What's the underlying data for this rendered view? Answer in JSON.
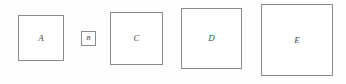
{
  "figure": {
    "background_color": "#fefefe",
    "border_color": "#8a8a8a",
    "label_color": "#4a4a4a",
    "width": 346,
    "height": 84,
    "squares": [
      {
        "label": "A",
        "x": 18,
        "y": 15,
        "size": 46,
        "size_class": "size-sm",
        "name": "square-a"
      },
      {
        "label": "B",
        "x": 81,
        "y": 31,
        "size": 15,
        "size_class": "size-xs",
        "name": "square-b"
      },
      {
        "label": "C",
        "x": 110,
        "y": 12,
        "size": 53,
        "size_class": "size-md",
        "name": "square-c"
      },
      {
        "label": "D",
        "x": 181,
        "y": 8,
        "size": 61,
        "size_class": "size-lg",
        "name": "square-d"
      },
      {
        "label": "E",
        "x": 261,
        "y": 4,
        "size": 72,
        "size_class": "size-xl",
        "name": "square-e"
      }
    ]
  }
}
